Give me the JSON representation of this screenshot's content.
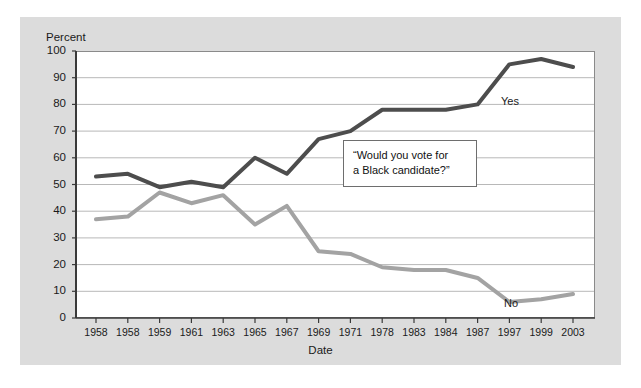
{
  "chart_data": {
    "type": "line",
    "title": "",
    "xlabel": "Date",
    "ylabel": "Percent",
    "ylim": [
      0,
      100
    ],
    "ytick_step": 10,
    "yticks": [
      100,
      90,
      80,
      70,
      60,
      50,
      40,
      30,
      20,
      10,
      0
    ],
    "categories": [
      "1958",
      "1958",
      "1959",
      "1961",
      "1963",
      "1965",
      "1967",
      "1969",
      "1971",
      "1978",
      "1983",
      "1984",
      "1987",
      "1997",
      "1999",
      "2003"
    ],
    "grid": "horizontal",
    "legend_position": "inline-end-of-line",
    "annotations": [
      {
        "name": "survey-question",
        "text_line_1": "“Would you vote for",
        "text_line_2": "a Black candidate?”"
      }
    ],
    "series": [
      {
        "name": "Yes",
        "label": "Yes",
        "color": "#4d4d4d",
        "values": [
          53,
          54,
          49,
          51,
          49,
          60,
          54,
          67,
          70,
          78,
          78,
          78,
          80,
          95,
          97,
          94
        ]
      },
      {
        "name": "No",
        "label": "No",
        "color": "#a3a3a3",
        "values": [
          37,
          38,
          47,
          43,
          46,
          35,
          42,
          25,
          24,
          19,
          18,
          18,
          15,
          6,
          7,
          9
        ]
      }
    ]
  },
  "colors": {
    "page_background": "#ffffff",
    "panel_background": "#dcdcdc",
    "plot_background": "#ffffff",
    "plot_border": "#8a8a8a",
    "gridline": "#b8b8b8",
    "axis": "#3a3a3a",
    "text": "#1a1a1a",
    "series_yes": "#4d4d4d",
    "series_no": "#a3a3a3",
    "annotation_border": "#6e6e6e"
  }
}
